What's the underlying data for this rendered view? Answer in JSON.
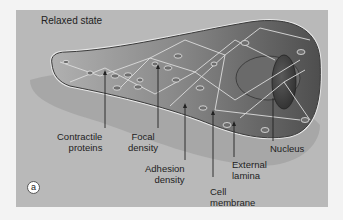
{
  "figure": {
    "title": "Relaxed state",
    "panel_letter": "a",
    "colors": {
      "page_background": "#f3f3f3",
      "panel_background": "#b9b9b9",
      "cell_light": "#a8a8a8",
      "cell_dark": "#555555",
      "nucleus": "#3e3e3e",
      "nucleus_shadow": "#6f6f6f",
      "cell_shadow": "#9c9c9c",
      "protein_lines": "#e6e6e6"
    },
    "labels": [
      {
        "id": "contractile-proteins",
        "lines": [
          "Contractile",
          "proteins"
        ]
      },
      {
        "id": "focal-density",
        "lines": [
          "Focal",
          "density"
        ]
      },
      {
        "id": "adhesion-density",
        "lines": [
          "Adhesion",
          "density"
        ]
      },
      {
        "id": "cell-membrane",
        "lines": [
          "Cell",
          "membrane"
        ]
      },
      {
        "id": "external-lamina",
        "lines": [
          "External",
          "lamina"
        ]
      },
      {
        "id": "nucleus",
        "lines": [
          "Nucleus"
        ]
      }
    ]
  }
}
